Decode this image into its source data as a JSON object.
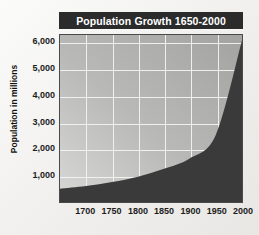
{
  "chart_data": {
    "type": "area",
    "title": "Population Growth 1650-2000",
    "xlabel": "",
    "ylabel": "Population in millions",
    "x": [
      1650,
      1700,
      1750,
      1800,
      1850,
      1900,
      1950,
      2000
    ],
    "values": [
      500,
      600,
      750,
      950,
      1250,
      1650,
      2550,
      6100
    ],
    "series": [
      {
        "name": "World population",
        "values": [
          500,
          600,
          750,
          950,
          1250,
          1650,
          2550,
          6100
        ]
      }
    ],
    "xticks": [
      "1700",
      "1750",
      "1800",
      "1850",
      "1900",
      "1950",
      "2000"
    ],
    "xtick_values": [
      1700,
      1750,
      1800,
      1850,
      1900,
      1950,
      2000
    ],
    "yticks": [
      "1,000",
      "2,000",
      "3,000",
      "4,000",
      "5,000",
      "6,000"
    ],
    "ytick_values": [
      1000,
      2000,
      3000,
      4000,
      5000,
      6000
    ],
    "xlim": [
      1650,
      2000
    ],
    "ylim": [
      0,
      6300
    ],
    "grid": true,
    "legend": "none",
    "colors": {
      "area_fill": "#3a3a3a",
      "plot_background_light": "#d8d8d6",
      "plot_background_dark": "#a3a3a1",
      "gridline": "#f4f4f2",
      "title_banner": "#2b2b2b",
      "title_text": "#ffffff",
      "axis_text": "#1c1c1c",
      "page_background": "#f2f2f0"
    }
  }
}
